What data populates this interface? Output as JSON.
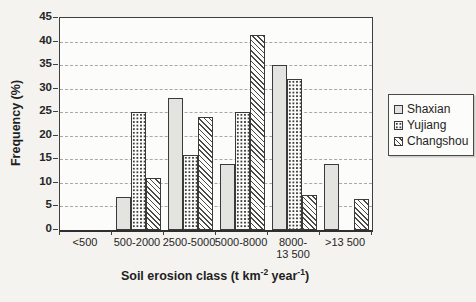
{
  "figure": {
    "x_title_parts": {
      "prefix": "Soil erosion class (t km",
      "sup1": "-2",
      "mid": " year",
      "sup2": "-1",
      "suffix": ")"
    }
  },
  "chart_data": {
    "type": "bar",
    "title": "",
    "categories": [
      "<500",
      "500-2000",
      "2500-5000",
      "5000-8000",
      "8000-\n13 500",
      ">13 500"
    ],
    "series": [
      {
        "name": "Shaxian",
        "pattern": "solid-gray",
        "fill": "#e3e3e0",
        "values": [
          0,
          7,
          28,
          14,
          35,
          14
        ]
      },
      {
        "name": "Yujiang",
        "pattern": "dots",
        "fill": "#fdfdfb",
        "values": [
          0,
          25,
          16,
          25,
          32,
          0
        ]
      },
      {
        "name": "Changshou",
        "pattern": "diagonal-hatch",
        "fill": "#fdfdfb",
        "values": [
          0,
          11,
          24,
          41.5,
          7.5,
          6.5
        ]
      }
    ],
    "xlabel": "Soil erosion class (t km-2 year-1)",
    "ylabel": "Frequency (%)",
    "ylim": [
      0,
      45
    ],
    "y_ticks": [
      0,
      5,
      10,
      15,
      20,
      25,
      30,
      35,
      40,
      45
    ],
    "grid": "horizontal-dashed",
    "legend_position": "right",
    "colors": {
      "border": "#3a3a3a",
      "gridline": "#a8a8a4",
      "bar_gray": "#e3e3e0",
      "background": "#f4f3f0"
    }
  }
}
